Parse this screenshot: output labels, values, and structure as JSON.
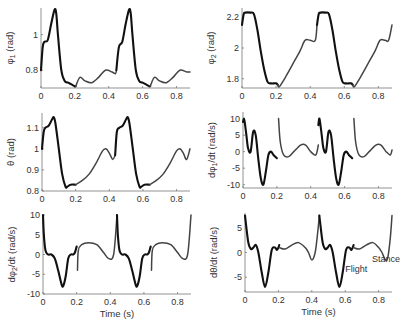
{
  "figure": {
    "annotations": {
      "flight": "Flight",
      "stance": "Stance"
    },
    "xlabel": "Time (s)"
  },
  "chart_data": [
    {
      "type": "line",
      "id": "phi1",
      "ylabel": "φ1 (rad)",
      "xlabel": "",
      "xlim": [
        0,
        0.88
      ],
      "ylim": [
        0.7,
        1.15
      ],
      "xticks": [
        0,
        0.2,
        0.4,
        0.6,
        0.8
      ],
      "xtick_labels": [
        "0",
        "0.2",
        "0.4",
        "0.6",
        "0.8"
      ],
      "yticks": [
        0.8,
        1.0
      ],
      "ytick_labels": [
        "0.8",
        "1"
      ],
      "box": {
        "x0": 41,
        "x1": 190,
        "y0": 8,
        "y1": 88
      },
      "series": [
        {
          "name": "Flight",
          "style": "flight",
          "x": [
            0,
            0.01,
            0.02,
            0.04,
            0.06,
            0.08,
            0.09,
            0.1,
            0.12,
            0.14,
            0.16,
            0.18,
            0.2,
            0.205
          ],
          "y": [
            0.8,
            0.93,
            0.96,
            0.97,
            1.06,
            1.14,
            1.12,
            1.0,
            0.8,
            0.74,
            0.73,
            0.72,
            0.71,
            0.71
          ]
        },
        {
          "name": "Stance",
          "style": "stance",
          "x": [
            0.205,
            0.23,
            0.26,
            0.3,
            0.34,
            0.38,
            0.42,
            0.44,
            0.445
          ],
          "y": [
            0.71,
            0.76,
            0.74,
            0.73,
            0.76,
            0.8,
            0.79,
            0.78,
            0.8
          ]
        },
        {
          "name": "Flight",
          "style": "flight",
          "x": [
            0.445,
            0.46,
            0.48,
            0.5,
            0.52,
            0.53,
            0.54,
            0.56,
            0.58,
            0.6,
            0.62,
            0.64,
            0.645
          ],
          "y": [
            0.8,
            0.93,
            0.96,
            1.06,
            1.14,
            1.12,
            1.0,
            0.8,
            0.74,
            0.73,
            0.72,
            0.71,
            0.71
          ]
        },
        {
          "name": "Stance",
          "style": "stance",
          "x": [
            0.645,
            0.67,
            0.7,
            0.74,
            0.78,
            0.82,
            0.86,
            0.88
          ],
          "y": [
            0.71,
            0.76,
            0.74,
            0.73,
            0.76,
            0.8,
            0.79,
            0.79
          ]
        }
      ]
    },
    {
      "type": "line",
      "id": "phi2",
      "ylabel": "φ2 (rad)",
      "xlabel": "",
      "xlim": [
        0,
        0.88
      ],
      "ylim": [
        1.74,
        2.26
      ],
      "xticks": [
        0,
        0.2,
        0.4,
        0.6,
        0.8
      ],
      "xtick_labels": [
        "0",
        "0.2",
        "0.4",
        "0.6",
        "0.8"
      ],
      "yticks": [
        1.8,
        2.0,
        2.2
      ],
      "ytick_labels": [
        "1.8",
        "2",
        "2.2"
      ],
      "box": {
        "x0": 242,
        "x1": 392,
        "y0": 8,
        "y1": 88
      },
      "series": [
        {
          "name": "Flight",
          "style": "flight",
          "x": [
            0,
            0.01,
            0.02,
            0.05,
            0.07,
            0.09,
            0.11,
            0.13,
            0.15,
            0.17,
            0.2,
            0.21
          ],
          "y": [
            2.15,
            2.22,
            2.23,
            2.23,
            2.22,
            2.12,
            1.98,
            1.86,
            1.78,
            1.77,
            1.77,
            1.76
          ]
        },
        {
          "name": "Stance",
          "style": "stance",
          "x": [
            0.21,
            0.22,
            0.26,
            0.3,
            0.34,
            0.37,
            0.4,
            0.43,
            0.44
          ],
          "y": [
            1.76,
            1.75,
            1.82,
            1.9,
            1.98,
            2.05,
            2.05,
            2.05,
            2.15
          ]
        },
        {
          "name": "Flight",
          "style": "flight",
          "x": [
            0.44,
            0.45,
            0.46,
            0.49,
            0.51,
            0.53,
            0.55,
            0.57,
            0.59,
            0.61,
            0.64,
            0.65
          ],
          "y": [
            2.15,
            2.22,
            2.23,
            2.23,
            2.22,
            2.12,
            1.98,
            1.86,
            1.78,
            1.77,
            1.77,
            1.76
          ]
        },
        {
          "name": "Stance",
          "style": "stance",
          "x": [
            0.65,
            0.66,
            0.7,
            0.74,
            0.78,
            0.81,
            0.84,
            0.86,
            0.88
          ],
          "y": [
            1.76,
            1.75,
            1.82,
            1.9,
            1.98,
            2.05,
            2.05,
            2.05,
            2.15
          ]
        }
      ]
    },
    {
      "type": "line",
      "id": "theta",
      "ylabel": "θ (rad)",
      "xlabel": "",
      "xlim": [
        0,
        0.88
      ],
      "ylim": [
        0.8,
        1.17
      ],
      "xticks": [
        0,
        0.2,
        0.4,
        0.6,
        0.8
      ],
      "xtick_labels": [
        "0",
        "0.2",
        "0.4",
        "0.6",
        "0.8"
      ],
      "yticks": [
        0.8,
        0.9,
        1.0,
        1.1
      ],
      "ytick_labels": [
        "0.8",
        "0.9",
        "1",
        "1.1"
      ],
      "box": {
        "x0": 42,
        "x1": 190,
        "y0": 113,
        "y1": 191
      },
      "series": [
        {
          "name": "Flight",
          "style": "flight",
          "x": [
            0,
            0.01,
            0.02,
            0.04,
            0.06,
            0.07,
            0.08,
            0.1,
            0.12,
            0.14,
            0.15,
            0.17,
            0.2
          ],
          "y": [
            1.0,
            1.08,
            1.1,
            1.11,
            1.14,
            1.15,
            1.12,
            1.0,
            0.88,
            0.82,
            0.82,
            0.83,
            0.83
          ]
        },
        {
          "name": "Stance",
          "style": "stance",
          "x": [
            0.2,
            0.24,
            0.28,
            0.32,
            0.36,
            0.38,
            0.4,
            0.42,
            0.435
          ],
          "y": [
            0.83,
            0.85,
            0.88,
            0.93,
            0.99,
            1.0,
            0.98,
            0.95,
            0.97
          ]
        },
        {
          "name": "Flight",
          "style": "flight",
          "x": [
            0.435,
            0.445,
            0.46,
            0.48,
            0.5,
            0.51,
            0.52,
            0.54,
            0.56,
            0.58,
            0.59,
            0.61,
            0.64
          ],
          "y": [
            0.97,
            1.08,
            1.1,
            1.11,
            1.14,
            1.15,
            1.12,
            1.0,
            0.88,
            0.82,
            0.82,
            0.83,
            0.83
          ]
        },
        {
          "name": "Stance",
          "style": "stance",
          "x": [
            0.64,
            0.68,
            0.72,
            0.76,
            0.8,
            0.82,
            0.84,
            0.86,
            0.88
          ],
          "y": [
            0.83,
            0.85,
            0.88,
            0.93,
            0.99,
            1.0,
            0.98,
            0.95,
            1.0
          ]
        }
      ]
    },
    {
      "type": "line",
      "id": "dphi1",
      "ylabel": "dφ1/dt (rad/s)",
      "xlabel": "",
      "xlim": [
        0,
        0.88
      ],
      "ylim": [
        -11,
        12
      ],
      "xticks": [
        0,
        0.2,
        0.4,
        0.6,
        0.8
      ],
      "xtick_labels": [
        "0",
        "0.2",
        "0.4",
        "0.6",
        "0.8"
      ],
      "yticks": [
        -10,
        -5,
        0,
        5,
        10
      ],
      "ytick_labels": [
        "-10",
        "-5",
        "0",
        "5",
        "10"
      ],
      "box": {
        "x0": 243,
        "x1": 392,
        "y0": 112,
        "y1": 188
      },
      "series": [
        {
          "name": "Flight",
          "style": "flight",
          "x": [
            0,
            0.005,
            0.01,
            0.02,
            0.03,
            0.045,
            0.06,
            0.075,
            0.09,
            0.105,
            0.12,
            0.135,
            0.15,
            0.165,
            0.18,
            0.2
          ],
          "y": [
            9,
            10,
            9,
            5,
            1,
            0,
            6,
            5,
            -2,
            -8,
            -10,
            -6,
            -1,
            0,
            -1,
            -2
          ]
        },
        {
          "name": "Stance",
          "style": "stance",
          "x": [
            0.21,
            0.22,
            0.24,
            0.27,
            0.3,
            0.34,
            0.37,
            0.4,
            0.43,
            0.445
          ],
          "y": [
            10,
            3,
            -1,
            -1.5,
            0,
            2,
            2,
            0,
            -1,
            2
          ]
        },
        {
          "name": "Flight",
          "style": "flight",
          "x": [
            0.445,
            0.45,
            0.455,
            0.465,
            0.475,
            0.49,
            0.505,
            0.52,
            0.535,
            0.55,
            0.565,
            0.58,
            0.595,
            0.61,
            0.625,
            0.645
          ],
          "y": [
            8,
            10,
            9,
            5,
            1,
            0,
            6,
            5,
            -2,
            -8,
            -10,
            -6,
            -1,
            0,
            -1,
            -2
          ]
        },
        {
          "name": "Stance",
          "style": "stance",
          "x": [
            0.655,
            0.665,
            0.685,
            0.715,
            0.745,
            0.785,
            0.815,
            0.845,
            0.87,
            0.88
          ],
          "y": [
            10,
            3,
            -1,
            -1.5,
            0,
            2,
            2,
            0,
            -1,
            0.5
          ]
        }
      ]
    },
    {
      "type": "line",
      "id": "dphi2",
      "ylabel": "dφ2/dt (rad/s)",
      "xlabel": "Time (s)",
      "xlim": [
        0,
        0.88
      ],
      "ylim": [
        -10,
        10
      ],
      "xticks": [
        0,
        0.2,
        0.4,
        0.6,
        0.8
      ],
      "xtick_labels": [
        "0",
        "0.2",
        "0.4",
        "0.6",
        "0.8"
      ],
      "yticks": [
        -10,
        -5,
        0,
        5,
        10
      ],
      "ytick_labels": [
        "-10",
        "-5",
        "0",
        "5",
        "10"
      ],
      "box": {
        "x0": 43,
        "x1": 191,
        "y0": 215,
        "y1": 294
      },
      "series": [
        {
          "name": "Flight",
          "style": "flight",
          "x": [
            0,
            0.005,
            0.015,
            0.03,
            0.05,
            0.07,
            0.09,
            0.11,
            0.12,
            0.135,
            0.15,
            0.165,
            0.18,
            0.19,
            0.2
          ],
          "y": [
            10,
            5,
            1,
            0,
            0,
            -1,
            -4,
            -7.5,
            -8,
            -5.5,
            -1,
            0,
            0,
            0.5,
            2
          ]
        },
        {
          "name": "Stance",
          "style": "stance",
          "x": [
            0.205,
            0.21,
            0.23,
            0.27,
            0.32,
            0.36,
            0.39,
            0.42,
            0.44
          ],
          "y": [
            -4,
            1,
            2.5,
            3,
            2.5,
            0.5,
            -1,
            0,
            10
          ]
        },
        {
          "name": "Flight",
          "style": "flight",
          "x": [
            0.44,
            0.445,
            0.455,
            0.47,
            0.49,
            0.51,
            0.53,
            0.55,
            0.56,
            0.575,
            0.59,
            0.605,
            0.62,
            0.63,
            0.64
          ],
          "y": [
            10,
            5,
            1,
            0,
            0,
            -1,
            -4,
            -7.5,
            -8,
            -5.5,
            -1,
            0,
            0,
            0.5,
            2
          ]
        },
        {
          "name": "Stance",
          "style": "stance",
          "x": [
            0.645,
            0.65,
            0.67,
            0.71,
            0.76,
            0.8,
            0.83,
            0.86,
            0.88
          ],
          "y": [
            -4,
            1,
            2.5,
            3,
            2.5,
            0.5,
            -1,
            0,
            10
          ]
        }
      ]
    },
    {
      "type": "line",
      "id": "dtheta",
      "ylabel": "dθ/dt (rad/s)",
      "xlabel": "Time (s)",
      "xlim": [
        0,
        0.88
      ],
      "ylim": [
        -8,
        8
      ],
      "xticks": [
        0,
        0.2,
        0.4,
        0.6,
        0.8
      ],
      "xtick_labels": [
        "0",
        "0.2",
        "0.4",
        "0.6",
        "0.8"
      ],
      "yticks": [
        -5,
        0,
        5
      ],
      "ytick_labels": [
        "-5",
        "0",
        "5"
      ],
      "box": {
        "x0": 245,
        "x1": 392,
        "y0": 213,
        "y1": 292
      },
      "annotations": [
        {
          "text": "Flight",
          "x": 0.6,
          "y": -4
        },
        {
          "text": "Stance",
          "x": 0.76,
          "y": -2
        }
      ],
      "series": [
        {
          "name": "Flight",
          "style": "flight",
          "x": [
            0,
            0.005,
            0.02,
            0.035,
            0.05,
            0.065,
            0.08,
            0.1,
            0.12,
            0.14,
            0.16,
            0.18,
            0.19,
            0.2,
            0.205
          ],
          "y": [
            7.5,
            6,
            2,
            0.7,
            1,
            1.5,
            0,
            -4,
            -7,
            -4,
            0.5,
            1,
            0.5,
            1,
            1.5
          ]
        },
        {
          "name": "Stance",
          "style": "stance",
          "x": [
            0.205,
            0.24,
            0.28,
            0.32,
            0.36,
            0.38,
            0.4,
            0.42,
            0.435,
            0.445
          ],
          "y": [
            1,
            0.7,
            1.5,
            2,
            1,
            0,
            -1.5,
            0,
            4,
            7.5
          ]
        },
        {
          "name": "Flight",
          "style": "flight",
          "x": [
            0.445,
            0.45,
            0.465,
            0.48,
            0.495,
            0.51,
            0.525,
            0.545,
            0.565,
            0.585,
            0.605,
            0.625,
            0.635,
            0.645,
            0.65
          ],
          "y": [
            7.5,
            6,
            2,
            0.7,
            1,
            1.5,
            0,
            -4,
            -7,
            -4,
            0.5,
            1,
            0.5,
            1,
            1.5
          ]
        },
        {
          "name": "Stance",
          "style": "stance",
          "x": [
            0.65,
            0.685,
            0.725,
            0.765,
            0.8,
            0.82,
            0.84,
            0.855,
            0.87,
            0.88
          ],
          "y": [
            1,
            0.7,
            1.5,
            2,
            1,
            0,
            -1.5,
            -1,
            3,
            7.5
          ]
        }
      ]
    }
  ]
}
